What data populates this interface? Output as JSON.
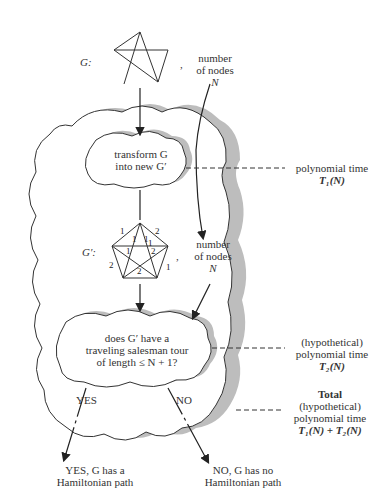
{
  "input": {
    "graph_label": "G:",
    "comma": ",",
    "nodes_label_line1": "number",
    "nodes_label_line2": "of nodes",
    "nodes_label_var": "N"
  },
  "step1": {
    "line1": "transform G",
    "line2": "into new G′",
    "time_label": "polynomial time",
    "time_expr": "T₁(N)"
  },
  "transformed": {
    "graph_label": "G′:",
    "comma": ",",
    "edge_weights": [
      "1",
      "2",
      "1",
      "1",
      "1",
      "1",
      "2",
      "2",
      "1",
      "2"
    ],
    "nodes_label_line1": "number",
    "nodes_label_line2": "of nodes",
    "nodes_label_var": "N"
  },
  "step2": {
    "line1": "does G′ have a",
    "line2": "traveling salesman tour",
    "line3": "of length ≤ N + 1?",
    "time_line1": "(hypothetical)",
    "time_line2": "polynomial time",
    "time_expr": "T₂(N)"
  },
  "total": {
    "line0": "Total",
    "line1": "(hypothetical)",
    "line2": "polynomial time",
    "expr": "T₁(N) + T₂(N)"
  },
  "branches": {
    "yes_label": "YES",
    "no_label": "NO",
    "yes_result_line1": "YES, G has a",
    "yes_result_line2": "Hamiltonian path",
    "no_result_line1": "NO, G has no",
    "no_result_line2": "Hamiltonian path"
  }
}
